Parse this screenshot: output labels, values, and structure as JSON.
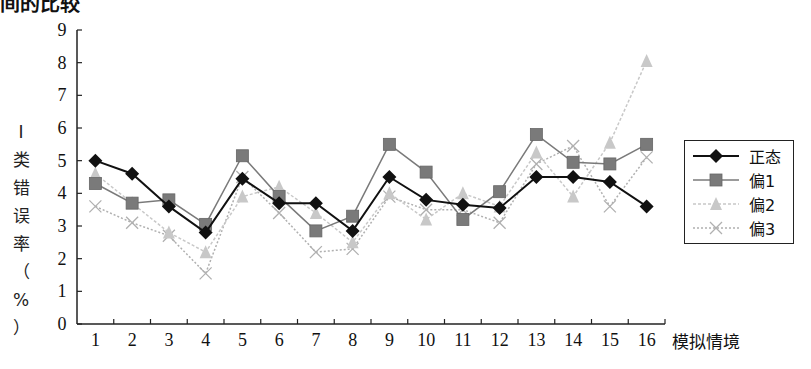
{
  "title": "间的比较",
  "chart_data": {
    "type": "line",
    "title": "间的比较",
    "xlabel": "模拟情境",
    "ylabel": "I类错误率（%）",
    "ylabel_chars": [
      "I",
      "类",
      "错",
      "误",
      "率",
      "（",
      "%",
      "）"
    ],
    "ylim": [
      0,
      9
    ],
    "yticks": [
      0,
      1,
      2,
      3,
      4,
      5,
      6,
      7,
      8,
      9
    ],
    "grid": false,
    "legend_position": "right",
    "categories": [
      "1",
      "2",
      "3",
      "4",
      "5",
      "6",
      "7",
      "8",
      "9",
      "10",
      "11",
      "12",
      "13",
      "14",
      "15",
      "16"
    ],
    "series": [
      {
        "name": "正态",
        "marker": "diamond",
        "color": "#111111",
        "dash": "",
        "values": [
          5.0,
          4.6,
          3.6,
          2.8,
          4.45,
          3.7,
          3.7,
          2.85,
          4.5,
          3.8,
          3.65,
          3.55,
          4.5,
          4.5,
          4.35,
          3.6
        ]
      },
      {
        "name": "偏1",
        "marker": "square",
        "color": "#7a7a7a",
        "dash": "",
        "values": [
          4.3,
          3.7,
          3.8,
          3.05,
          5.15,
          3.9,
          2.85,
          3.3,
          5.5,
          4.65,
          3.2,
          4.05,
          5.8,
          4.95,
          4.9,
          5.5
        ]
      },
      {
        "name": "偏2",
        "marker": "triangle",
        "color": "#c8c8c8",
        "dash": "3,2",
        "values": [
          4.6,
          3.7,
          2.8,
          2.2,
          3.9,
          4.2,
          3.4,
          2.5,
          4.0,
          3.2,
          4.0,
          3.6,
          5.25,
          3.9,
          5.55,
          8.05
        ]
      },
      {
        "name": "偏3",
        "marker": "x",
        "color": "#b0b0b0",
        "dash": "2,2",
        "values": [
          3.6,
          3.1,
          2.7,
          1.55,
          4.5,
          3.4,
          2.2,
          2.3,
          3.9,
          3.5,
          3.5,
          3.1,
          4.9,
          5.45,
          3.6,
          5.1
        ]
      }
    ]
  }
}
